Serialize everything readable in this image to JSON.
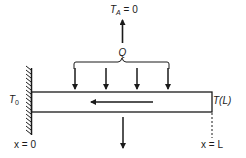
{
  "diagram": {
    "title_label": {
      "main": "T",
      "sub": "A",
      "rest": " = 0"
    },
    "load_label": "Q",
    "left_temp_label": {
      "main": "T",
      "sub": "0"
    },
    "right_temp_label": "T(L)",
    "left_position_label": "x = 0",
    "right_position_label": "x = L",
    "load_arrow_count": 4,
    "colors": {
      "stroke": "#1a1a1a",
      "background": "#ffffff"
    }
  }
}
